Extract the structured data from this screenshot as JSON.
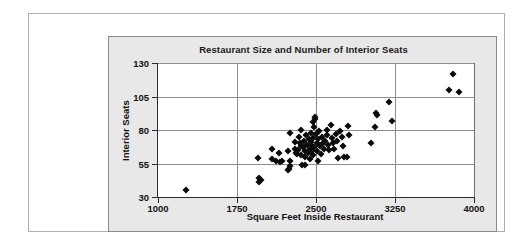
{
  "chart_data": {
    "type": "scatter",
    "title": "Restaurant Size and Number of Interior Seats",
    "xlabel": "Square Feet Inside Restaurant",
    "ylabel": "Interior Seats",
    "xlim": [
      1000,
      4000
    ],
    "ylim": [
      30,
      130
    ],
    "xticks": [
      1000,
      1750,
      2500,
      3250,
      4000
    ],
    "yticks": [
      30,
      55,
      80,
      105,
      130
    ],
    "grid": "both",
    "legend": "none",
    "marker": "diamond",
    "marker_color": "#0a0a0a",
    "points": [
      {
        "x": 1270,
        "y": 35
      },
      {
        "x": 1955,
        "y": 41
      },
      {
        "x": 1960,
        "y": 44
      },
      {
        "x": 1975,
        "y": 43
      },
      {
        "x": 1950,
        "y": 59
      },
      {
        "x": 2085,
        "y": 58
      },
      {
        "x": 2120,
        "y": 57
      },
      {
        "x": 2160,
        "y": 56
      },
      {
        "x": 2180,
        "y": 57
      },
      {
        "x": 2235,
        "y": 50
      },
      {
        "x": 2245,
        "y": 51
      },
      {
        "x": 2255,
        "y": 53
      },
      {
        "x": 2080,
        "y": 66
      },
      {
        "x": 2150,
        "y": 63
      },
      {
        "x": 2230,
        "y": 64
      },
      {
        "x": 2250,
        "y": 78
      },
      {
        "x": 2300,
        "y": 71
      },
      {
        "x": 2300,
        "y": 66
      },
      {
        "x": 2310,
        "y": 63
      },
      {
        "x": 2320,
        "y": 62
      },
      {
        "x": 2330,
        "y": 65
      },
      {
        "x": 2335,
        "y": 75
      },
      {
        "x": 2345,
        "y": 70
      },
      {
        "x": 2355,
        "y": 68
      },
      {
        "x": 2360,
        "y": 61
      },
      {
        "x": 2370,
        "y": 54
      },
      {
        "x": 2380,
        "y": 67
      },
      {
        "x": 2390,
        "y": 72
      },
      {
        "x": 2395,
        "y": 64
      },
      {
        "x": 2400,
        "y": 60
      },
      {
        "x": 2405,
        "y": 76
      },
      {
        "x": 2415,
        "y": 69
      },
      {
        "x": 2420,
        "y": 63
      },
      {
        "x": 2430,
        "y": 73
      },
      {
        "x": 2440,
        "y": 66
      },
      {
        "x": 2445,
        "y": 58
      },
      {
        "x": 2450,
        "y": 78
      },
      {
        "x": 2455,
        "y": 71
      },
      {
        "x": 2460,
        "y": 64
      },
      {
        "x": 2465,
        "y": 68
      },
      {
        "x": 2470,
        "y": 61
      },
      {
        "x": 2475,
        "y": 74
      },
      {
        "x": 2480,
        "y": 67
      },
      {
        "x": 2485,
        "y": 82
      },
      {
        "x": 2490,
        "y": 88
      },
      {
        "x": 2495,
        "y": 90
      },
      {
        "x": 2500,
        "y": 77
      },
      {
        "x": 2505,
        "y": 70
      },
      {
        "x": 2510,
        "y": 64
      },
      {
        "x": 2515,
        "y": 57
      },
      {
        "x": 2520,
        "y": 73
      },
      {
        "x": 2530,
        "y": 79
      },
      {
        "x": 2540,
        "y": 68
      },
      {
        "x": 2550,
        "y": 62
      },
      {
        "x": 2560,
        "y": 75
      },
      {
        "x": 2570,
        "y": 70
      },
      {
        "x": 2580,
        "y": 66
      },
      {
        "x": 2590,
        "y": 72
      },
      {
        "x": 2600,
        "y": 80
      },
      {
        "x": 2605,
        "y": 76
      },
      {
        "x": 2615,
        "y": 69
      },
      {
        "x": 2625,
        "y": 65
      },
      {
        "x": 2640,
        "y": 84
      },
      {
        "x": 2650,
        "y": 74
      },
      {
        "x": 2660,
        "y": 70
      },
      {
        "x": 2670,
        "y": 66
      },
      {
        "x": 2690,
        "y": 77
      },
      {
        "x": 2700,
        "y": 72
      },
      {
        "x": 2710,
        "y": 59
      },
      {
        "x": 2730,
        "y": 79
      },
      {
        "x": 2745,
        "y": 75
      },
      {
        "x": 2760,
        "y": 68
      },
      {
        "x": 2770,
        "y": 60
      },
      {
        "x": 2790,
        "y": 60
      },
      {
        "x": 2800,
        "y": 83
      },
      {
        "x": 2810,
        "y": 76
      },
      {
        "x": 2470,
        "y": 86
      },
      {
        "x": 2360,
        "y": 80
      },
      {
        "x": 2250,
        "y": 57
      },
      {
        "x": 2395,
        "y": 54
      },
      {
        "x": 3020,
        "y": 70
      },
      {
        "x": 3060,
        "y": 82
      },
      {
        "x": 3065,
        "y": 93
      },
      {
        "x": 3075,
        "y": 91
      },
      {
        "x": 3190,
        "y": 101
      },
      {
        "x": 3220,
        "y": 87
      },
      {
        "x": 3760,
        "y": 110
      },
      {
        "x": 3800,
        "y": 122
      },
      {
        "x": 3860,
        "y": 108
      }
    ]
  },
  "axes": {
    "y_tick_labels": [
      "130",
      "105",
      "80",
      "55",
      "30"
    ],
    "x_tick_labels": [
      "1000",
      "1750",
      "2500",
      "3250",
      "4000"
    ]
  }
}
